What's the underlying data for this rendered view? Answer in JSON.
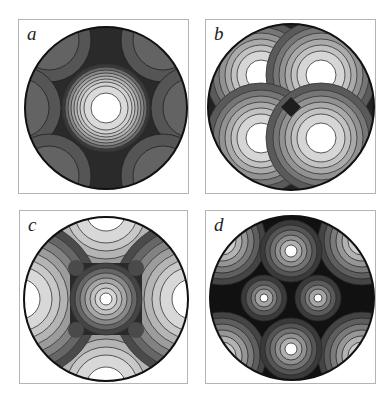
{
  "figure": {
    "panels": [
      {
        "label": "a",
        "description": "Contour map in circular domain: central bright peak with six dark-grey lobes around the rim"
      },
      {
        "label": "b",
        "description": "Contour map in circular domain: four bright peaks arranged in a 2x2 grid, dark saddle at center"
      },
      {
        "label": "c",
        "description": "Contour map in circular domain: central peak, four half-peaks at top/bottom/left/right rim, four small dark spots"
      },
      {
        "label": "d",
        "description": "Contour map in circular domain: two small central peaks, peaks at top and bottom, four quarter-peaks at rim corners"
      }
    ]
  },
  "colors": {
    "background": "#ffffff",
    "frame": "#b4b4b4",
    "contour_line": "#333333",
    "peak": "#ffffff",
    "dark": "#1a1a1a"
  }
}
